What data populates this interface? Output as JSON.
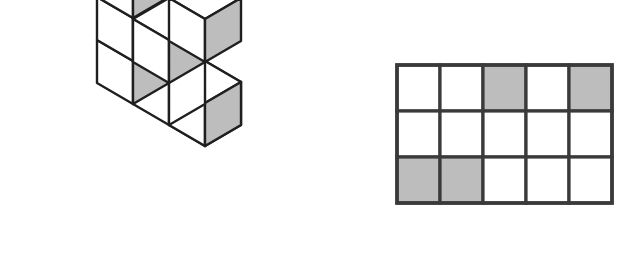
{
  "figure": {
    "title": "Isometric cube arrangement and its plan grid",
    "colors": {
      "outline": "#1f1f1f",
      "face_light": "#ffffff",
      "face_shaded": "#bdbdbd",
      "background": "#ffffff",
      "grid_line": "#3a3a3a"
    },
    "iso": {
      "name": "isometric-cube-figure",
      "description": "Three-armed arrangement of unit cubes drawn in isometric projection",
      "cube_count": 9,
      "origin": {
        "x": 133,
        "y": 19
      },
      "unit": {
        "half_width": 36,
        "half_height": 21,
        "height": 43
      },
      "cubes": [
        {
          "id": "tower-top",
          "col": 0,
          "row": 0,
          "level": 2,
          "top": "light",
          "left": "light",
          "right": "shaded"
        },
        {
          "id": "tower-mid",
          "col": 0,
          "row": 0,
          "level": 1,
          "top": "hidden",
          "left": "light",
          "right": "shaded"
        },
        {
          "id": "center-base",
          "col": 0,
          "row": 0,
          "level": 0,
          "top": "hidden",
          "left": "light",
          "right": "shaded"
        },
        {
          "id": "left-arm-near",
          "col": -1,
          "row": 0,
          "level": 0,
          "top": "light",
          "left": "light",
          "right": "shaded"
        },
        {
          "id": "left-arm-far",
          "col": -2,
          "row": 0,
          "level": 0,
          "top": "light",
          "left": "light",
          "right": "shaded"
        },
        {
          "id": "right-arm-1",
          "col": 0,
          "row": 1,
          "level": 0,
          "top": "light",
          "left": "light",
          "right": "light"
        },
        {
          "id": "right-arm-1b",
          "col": 0,
          "row": 1,
          "level": 1,
          "top": "light",
          "left": "light",
          "right": "shaded"
        },
        {
          "id": "right-arm-2",
          "col": 0,
          "row": 2,
          "level": 0,
          "top": "light",
          "left": "light",
          "right": "shaded"
        },
        {
          "id": "right-arm-3",
          "col": 0,
          "row": 2,
          "level": 0,
          "top": "light",
          "left": "light",
          "right": "shaded"
        }
      ]
    },
    "grid": {
      "name": "plan-grid",
      "description": "Rectangular plan grid of squares, some shaded",
      "columns": 5,
      "rows": 3,
      "bounds": {
        "x": 397,
        "y": 65,
        "width": 215,
        "height": 138
      },
      "cells": [
        [
          "light",
          "light",
          "shaded",
          "light",
          "shaded"
        ],
        [
          "light",
          "light",
          "light",
          "light",
          "light"
        ],
        [
          "shaded",
          "shaded",
          "light",
          "light",
          "light"
        ]
      ],
      "shaded_count": 4
    }
  }
}
